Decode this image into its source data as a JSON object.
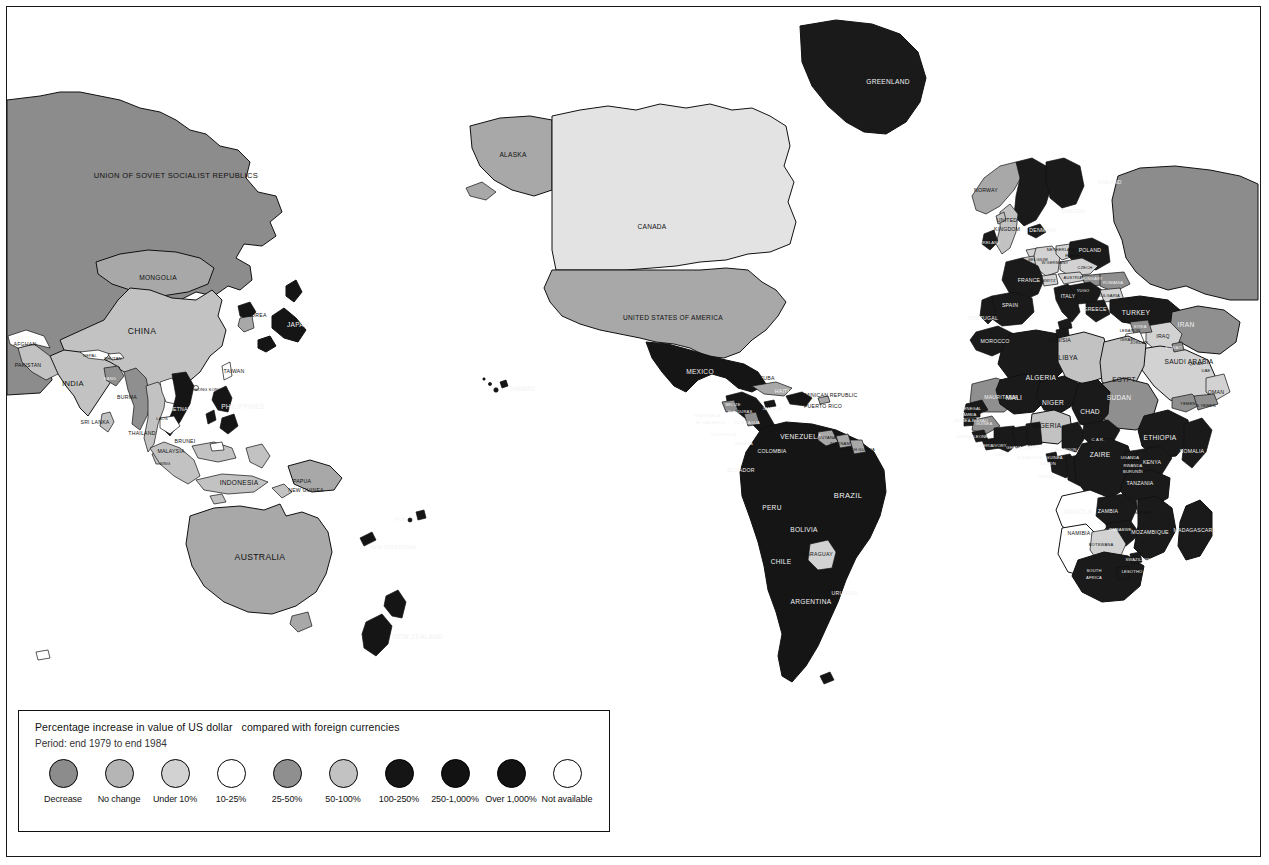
{
  "document": {
    "type": "thematic world map",
    "subject": "Percentage increase in value of US dollar compared with foreign currencies"
  },
  "legend": {
    "title": "Percentage increase in value of US dollar   compared with foreign currencies",
    "period": "Period: end 1979 to end 1984",
    "items": [
      {
        "label": "Decrease",
        "color": "#8c8c8c"
      },
      {
        "label": "No change",
        "color": "#b5b5b5"
      },
      {
        "label": "Under 10%",
        "color": "#d2d2d2"
      },
      {
        "label": "10-25%",
        "color": "#ffffff"
      },
      {
        "label": "25-50%",
        "color": "#8f8f8f"
      },
      {
        "label": "50-100%",
        "color": "#c2c2c2"
      },
      {
        "label": "100-250%",
        "color": "#151515"
      },
      {
        "label": "250-1,000%",
        "color": "#121212"
      },
      {
        "label": "Over 1,000%",
        "color": "#121212"
      },
      {
        "label": "Not available",
        "color": "#ffffff"
      }
    ]
  },
  "colors": {
    "decrease": "#8c8c8c",
    "no_change": "#b5b5b5",
    "under_10": "#d2d2d2",
    "pct_10_25": "#ffffff",
    "pct_25_50": "#8f8f8f",
    "pct_50_100": "#c2c2c2",
    "pct_100_250": "#151515",
    "pct_250_1000": "#121212",
    "over_1000": "#121212",
    "not_available": "#ffffff",
    "ocean": "#ffffff",
    "outline": "#111111"
  },
  "map_labels": {
    "asia": [
      {
        "name": "UNION OF SOVIET SOCIALIST REPUBLICS",
        "x": 176,
        "y": 176,
        "size": "sz-lg"
      },
      {
        "name": "MONGOLIA",
        "x": 158,
        "y": 278,
        "size": "sz-md"
      },
      {
        "name": "CHINA",
        "x": 142,
        "y": 332,
        "size": "sz-xl"
      },
      {
        "name": "KOREA",
        "x": 257,
        "y": 316,
        "size": "sz-sm"
      },
      {
        "name": "JAPAN",
        "x": 298,
        "y": 325,
        "size": "sz-md"
      },
      {
        "name": "TAIWAN",
        "x": 234,
        "y": 372,
        "size": "sz-sm"
      },
      {
        "name": "HONG KONG",
        "x": 208,
        "y": 390,
        "size": "sz-xs"
      },
      {
        "name": "AFGHAN",
        "x": 25,
        "y": 345,
        "size": "sz-sm"
      },
      {
        "name": "PAKISTAN",
        "x": 28,
        "y": 366,
        "size": "sz-sm"
      },
      {
        "name": "INDIA",
        "x": 73,
        "y": 384,
        "size": "sz-lg"
      },
      {
        "name": "NEPAL",
        "x": 90,
        "y": 356,
        "size": "sz-xs"
      },
      {
        "name": "BHUTAN",
        "x": 113,
        "y": 359,
        "size": "sz-xs"
      },
      {
        "name": "BANG",
        "x": 110,
        "y": 379,
        "size": "sz-xs"
      },
      {
        "name": "BURMA",
        "x": 127,
        "y": 398,
        "size": "sz-sm"
      },
      {
        "name": "SRI LANKA",
        "x": 95,
        "y": 423,
        "size": "sz-sm"
      },
      {
        "name": "THAILAND",
        "x": 142,
        "y": 434,
        "size": "sz-sm"
      },
      {
        "name": "LAOS",
        "x": 162,
        "y": 419,
        "size": "sz-xs"
      },
      {
        "name": "VIETNAM",
        "x": 180,
        "y": 410,
        "size": "sz-sm"
      },
      {
        "name": "BRUNEI",
        "x": 185,
        "y": 442,
        "size": "sz-sm"
      },
      {
        "name": "MALAYSIA",
        "x": 171,
        "y": 452,
        "size": "sz-sm"
      },
      {
        "name": "SING",
        "x": 165,
        "y": 464,
        "size": "sz-xs"
      },
      {
        "name": "PHILIPPINES",
        "x": 243,
        "y": 407,
        "size": "sz-md"
      },
      {
        "name": "INDONESIA",
        "x": 239,
        "y": 483,
        "size": "sz-md"
      },
      {
        "name": "PAPUA",
        "x": 302,
        "y": 482,
        "size": "sz-sm"
      },
      {
        "name": "NEW GUINEA",
        "x": 306,
        "y": 491,
        "size": "sz-sm"
      }
    ],
    "oceania": [
      {
        "name": "AUSTRALIA",
        "x": 260,
        "y": 558,
        "size": "sz-xl"
      },
      {
        "name": "NEW ZEALAND",
        "x": 418,
        "y": 637,
        "size": "sz-md"
      },
      {
        "name": "FIJI",
        "x": 400,
        "y": 520,
        "size": "sz-sm"
      },
      {
        "name": "NEW CALEDONIA",
        "x": 393,
        "y": 548,
        "size": "sz-sm"
      }
    ],
    "north_america": [
      {
        "name": "ALASKA",
        "x": 513,
        "y": 155,
        "size": "sz-md"
      },
      {
        "name": "CANADA",
        "x": 652,
        "y": 227,
        "size": "sz-md"
      },
      {
        "name": "UNITED STATES OF AMERICA",
        "x": 673,
        "y": 318,
        "size": "sz-md"
      },
      {
        "name": "GREENLAND",
        "x": 888,
        "y": 82,
        "size": "sz-md"
      },
      {
        "name": "HAWAII",
        "x": 523,
        "y": 389,
        "size": "sz-md"
      }
    ],
    "central_america": [
      {
        "name": "MEXICO",
        "x": 700,
        "y": 372,
        "size": "sz-md"
      },
      {
        "name": "CUBA",
        "x": 767,
        "y": 379,
        "size": "sz-sm"
      },
      {
        "name": "HAITI",
        "x": 782,
        "y": 392,
        "size": "sz-sm"
      },
      {
        "name": "DOMINICAN REPUBLIC",
        "x": 827,
        "y": 396,
        "size": "sz-sm"
      },
      {
        "name": "PUERTO RICO",
        "x": 823,
        "y": 407,
        "size": "sz-sm"
      },
      {
        "name": "JAMAICA",
        "x": 772,
        "y": 409,
        "size": "sz-xs"
      },
      {
        "name": "BELIZE",
        "x": 733,
        "y": 405,
        "size": "sz-xs"
      },
      {
        "name": "GUATEMALA",
        "x": 707,
        "y": 416,
        "size": "sz-xs"
      },
      {
        "name": "HONDURAS",
        "x": 740,
        "y": 412,
        "size": "sz-xs"
      },
      {
        "name": "EL SALVADOR",
        "x": 711,
        "y": 423,
        "size": "sz-xs"
      },
      {
        "name": "NICARAGUA",
        "x": 747,
        "y": 423,
        "size": "sz-xs"
      },
      {
        "name": "COSTA RICA",
        "x": 723,
        "y": 435,
        "size": "sz-xs"
      },
      {
        "name": "PANAMA",
        "x": 744,
        "y": 444,
        "size": "sz-xs"
      }
    ],
    "south_america": [
      {
        "name": "VENEZUELA",
        "x": 801,
        "y": 437,
        "size": "sz-md"
      },
      {
        "name": "COLOMBIA",
        "x": 772,
        "y": 452,
        "size": "sz-sm"
      },
      {
        "name": "GUYANA",
        "x": 827,
        "y": 438,
        "size": "sz-xs"
      },
      {
        "name": "SURINAM",
        "x": 840,
        "y": 444,
        "size": "sz-xs"
      },
      {
        "name": "FRENCH GUIANA",
        "x": 857,
        "y": 450,
        "size": "sz-xs"
      },
      {
        "name": "ECUADOR",
        "x": 741,
        "y": 471,
        "size": "sz-sm"
      },
      {
        "name": "PERU",
        "x": 772,
        "y": 508,
        "size": "sz-md"
      },
      {
        "name": "BRAZIL",
        "x": 848,
        "y": 496,
        "size": "sz-lg"
      },
      {
        "name": "BOLIVIA",
        "x": 804,
        "y": 530,
        "size": "sz-md"
      },
      {
        "name": "PARAGUAY",
        "x": 818,
        "y": 555,
        "size": "sz-sm"
      },
      {
        "name": "CHILE",
        "x": 781,
        "y": 562,
        "size": "sz-md"
      },
      {
        "name": "URUGUAY",
        "x": 845,
        "y": 594,
        "size": "sz-sm"
      },
      {
        "name": "ARGENTINA",
        "x": 811,
        "y": 602,
        "size": "sz-md"
      }
    ],
    "europe": [
      {
        "name": "NORWAY",
        "x": 986,
        "y": 191,
        "size": "sz-sm"
      },
      {
        "name": "FINLAND",
        "x": 1110,
        "y": 183,
        "size": "sz-sm"
      },
      {
        "name": "SWEDEN",
        "x": 1073,
        "y": 212,
        "size": "sz-sm"
      },
      {
        "name": "DENMARK",
        "x": 1043,
        "y": 231,
        "size": "sz-sm"
      },
      {
        "name": "UNITED",
        "x": 1007,
        "y": 221,
        "size": "sz-sm"
      },
      {
        "name": "KINGDOM",
        "x": 1007,
        "y": 230,
        "size": "sz-sm"
      },
      {
        "name": "IRELAND",
        "x": 991,
        "y": 243,
        "size": "sz-xs"
      },
      {
        "name": "NETHERLANDS",
        "x": 1063,
        "y": 250,
        "size": "sz-xs"
      },
      {
        "name": "POLAND",
        "x": 1090,
        "y": 251,
        "size": "sz-sm"
      },
      {
        "name": "W.GERMANY",
        "x": 1055,
        "y": 263,
        "size": "sz-xs"
      },
      {
        "name": "E.GER",
        "x": 1072,
        "y": 256,
        "size": "sz-xs"
      },
      {
        "name": "CZECH",
        "x": 1085,
        "y": 268,
        "size": "sz-xs"
      },
      {
        "name": "BELGIUM",
        "x": 1038,
        "y": 260,
        "size": "sz-xs"
      },
      {
        "name": "FRANCE",
        "x": 1029,
        "y": 281,
        "size": "sz-sm"
      },
      {
        "name": "SWITZ",
        "x": 1049,
        "y": 281,
        "size": "sz-xs"
      },
      {
        "name": "AUSTRIA",
        "x": 1073,
        "y": 278,
        "size": "sz-xs"
      },
      {
        "name": "HUNGARY",
        "x": 1092,
        "y": 279,
        "size": "sz-xs"
      },
      {
        "name": "ROMANIA",
        "x": 1113,
        "y": 283,
        "size": "sz-xs"
      },
      {
        "name": "YUGO",
        "x": 1083,
        "y": 291,
        "size": "sz-xs"
      },
      {
        "name": "BULGARIA",
        "x": 1109,
        "y": 296,
        "size": "sz-xs"
      },
      {
        "name": "ITALY",
        "x": 1068,
        "y": 297,
        "size": "sz-sm"
      },
      {
        "name": "SPAIN",
        "x": 1010,
        "y": 306,
        "size": "sz-sm"
      },
      {
        "name": "PORTUGAL",
        "x": 983,
        "y": 319,
        "size": "sz-sm"
      },
      {
        "name": "GREECE",
        "x": 1095,
        "y": 310,
        "size": "sz-sm"
      },
      {
        "name": "TURKEY",
        "x": 1136,
        "y": 313,
        "size": "sz-md"
      }
    ],
    "middle_east": [
      {
        "name": "IRAN",
        "x": 1186,
        "y": 325,
        "size": "sz-md"
      },
      {
        "name": "IRAQ",
        "x": 1163,
        "y": 337,
        "size": "sz-sm"
      },
      {
        "name": "SYRIA",
        "x": 1140,
        "y": 327,
        "size": "sz-xs"
      },
      {
        "name": "LEBANON",
        "x": 1130,
        "y": 331,
        "size": "sz-xs"
      },
      {
        "name": "ISRAEL",
        "x": 1128,
        "y": 340,
        "size": "sz-xs"
      },
      {
        "name": "JORDAN",
        "x": 1139,
        "y": 343,
        "size": "sz-xs"
      },
      {
        "name": "SAUDI ARABIA",
        "x": 1189,
        "y": 362,
        "size": "sz-md"
      },
      {
        "name": "KUWAIT",
        "x": 1174,
        "y": 348,
        "size": "sz-xs"
      },
      {
        "name": "QATAR",
        "x": 1196,
        "y": 364,
        "size": "sz-xs"
      },
      {
        "name": "UAE",
        "x": 1206,
        "y": 371,
        "size": "sz-xs"
      },
      {
        "name": "OMAN",
        "x": 1216,
        "y": 393,
        "size": "sz-sm"
      },
      {
        "name": "YEMEN",
        "x": 1188,
        "y": 404,
        "size": "sz-xs"
      },
      {
        "name": "S.YEMEN",
        "x": 1206,
        "y": 406,
        "size": "sz-xs"
      }
    ],
    "africa": [
      {
        "name": "MOROCCO",
        "x": 995,
        "y": 342,
        "size": "sz-sm"
      },
      {
        "name": "TUNISIA",
        "x": 1060,
        "y": 341,
        "size": "sz-sm"
      },
      {
        "name": "LIBYA",
        "x": 1068,
        "y": 358,
        "size": "sz-md"
      },
      {
        "name": "ALGERIA",
        "x": 1041,
        "y": 378,
        "size": "sz-md"
      },
      {
        "name": "EGYPT",
        "x": 1124,
        "y": 380,
        "size": "sz-md"
      },
      {
        "name": "MAURITANIA",
        "x": 1001,
        "y": 398,
        "size": "sz-sm"
      },
      {
        "name": "MALI",
        "x": 1014,
        "y": 398,
        "size": "sz-md"
      },
      {
        "name": "NIGER",
        "x": 1053,
        "y": 403,
        "size": "sz-md"
      },
      {
        "name": "CHAD",
        "x": 1090,
        "y": 412,
        "size": "sz-md"
      },
      {
        "name": "SUDAN",
        "x": 1119,
        "y": 398,
        "size": "sz-md"
      },
      {
        "name": "SENEGAL",
        "x": 971,
        "y": 409,
        "size": "sz-xs"
      },
      {
        "name": "GAMBIA",
        "x": 968,
        "y": 415,
        "size": "sz-xs"
      },
      {
        "name": "GUINEA-BISSAU",
        "x": 971,
        "y": 421,
        "size": "sz-xs"
      },
      {
        "name": "GUINEA",
        "x": 984,
        "y": 424,
        "size": "sz-xs"
      },
      {
        "name": "SIERRA LEONE",
        "x": 972,
        "y": 437,
        "size": "sz-xs"
      },
      {
        "name": "LIBERIA",
        "x": 985,
        "y": 446,
        "size": "sz-xs"
      },
      {
        "name": "IVORY",
        "x": 1000,
        "y": 446,
        "size": "sz-xs"
      },
      {
        "name": "COAST",
        "x": 1000,
        "y": 455,
        "size": "sz-xs"
      },
      {
        "name": "GHANA",
        "x": 1014,
        "y": 448,
        "size": "sz-xs"
      },
      {
        "name": "TOGO",
        "x": 1026,
        "y": 449,
        "size": "sz-xs"
      },
      {
        "name": "BENIN",
        "x": 1033,
        "y": 447,
        "size": "sz-xs"
      },
      {
        "name": "NIGERIA",
        "x": 1047,
        "y": 426,
        "size": "sz-md"
      },
      {
        "name": "CAMEROON",
        "x": 1064,
        "y": 450,
        "size": "sz-xs"
      },
      {
        "name": "EQUATORIAL GUINEA",
        "x": 1040,
        "y": 458,
        "size": "sz-xs"
      },
      {
        "name": "GABON",
        "x": 1048,
        "y": 464,
        "size": "sz-xs"
      },
      {
        "name": "CONGO",
        "x": 1046,
        "y": 477,
        "size": "sz-xs"
      },
      {
        "name": "C.A.R.",
        "x": 1098,
        "y": 440,
        "size": "sz-xs"
      },
      {
        "name": "ZAIRE",
        "x": 1100,
        "y": 455,
        "size": "sz-md"
      },
      {
        "name": "ETHIOPIA",
        "x": 1160,
        "y": 438,
        "size": "sz-md"
      },
      {
        "name": "SOMALIA",
        "x": 1192,
        "y": 452,
        "size": "sz-sm"
      },
      {
        "name": "UGANDA",
        "x": 1130,
        "y": 458,
        "size": "sz-xs"
      },
      {
        "name": "KENYA",
        "x": 1152,
        "y": 463,
        "size": "sz-sm"
      },
      {
        "name": "RWANDA",
        "x": 1133,
        "y": 466,
        "size": "sz-xs"
      },
      {
        "name": "BURUNDI",
        "x": 1133,
        "y": 472,
        "size": "sz-xs"
      },
      {
        "name": "TANZANIA",
        "x": 1140,
        "y": 484,
        "size": "sz-sm"
      },
      {
        "name": "ANGOLA",
        "x": 1078,
        "y": 512,
        "size": "sz-md"
      },
      {
        "name": "ZAMBIA",
        "x": 1108,
        "y": 512,
        "size": "sz-sm"
      },
      {
        "name": "MALAWI",
        "x": 1143,
        "y": 513,
        "size": "sz-xs"
      },
      {
        "name": "ZIMBABWE",
        "x": 1120,
        "y": 530,
        "size": "sz-xs"
      },
      {
        "name": "MOZAMBIQUE",
        "x": 1150,
        "y": 533,
        "size": "sz-sm"
      },
      {
        "name": "NAMIBIA",
        "x": 1079,
        "y": 534,
        "size": "sz-sm"
      },
      {
        "name": "BOTSWANA",
        "x": 1101,
        "y": 545,
        "size": "sz-xs"
      },
      {
        "name": "SWAZILAND",
        "x": 1138,
        "y": 560,
        "size": "sz-xs"
      },
      {
        "name": "LESOTHO",
        "x": 1132,
        "y": 572,
        "size": "sz-xs"
      },
      {
        "name": "SOUTH",
        "x": 1094,
        "y": 571,
        "size": "sz-xs"
      },
      {
        "name": "AFRICA",
        "x": 1094,
        "y": 578,
        "size": "sz-xs"
      },
      {
        "name": "MADAGASCAR",
        "x": 1193,
        "y": 531,
        "size": "sz-sm"
      }
    ]
  }
}
